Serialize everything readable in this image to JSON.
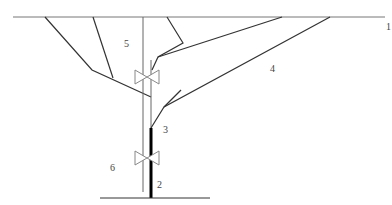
{
  "diagram": {
    "type": "well schematic",
    "colors": {
      "line": "#333333",
      "pipe_thin": "#666666",
      "pipe_thick": "#000000",
      "valve": "#888888"
    },
    "labels": [
      {
        "id": "1",
        "text": "1",
        "x": 386,
        "y": 22
      },
      {
        "id": "2",
        "text": "2",
        "x": 157,
        "y": 180
      },
      {
        "id": "3",
        "text": "3",
        "x": 163,
        "y": 125
      },
      {
        "id": "4",
        "text": "4",
        "x": 270,
        "y": 64
      },
      {
        "id": "5",
        "text": "5",
        "x": 124,
        "y": 39
      },
      {
        "id": "6",
        "text": "6",
        "x": 110,
        "y": 163
      }
    ]
  }
}
